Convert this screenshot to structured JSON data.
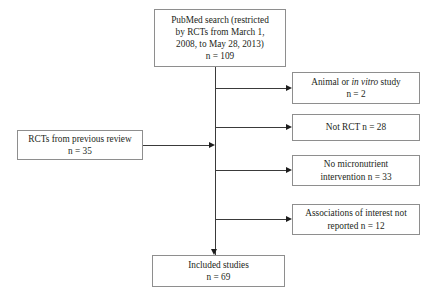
{
  "diagram": {
    "type": "flowchart",
    "colors": {
      "background": "#ffffff",
      "box_border": "#8e8e8e",
      "connector": "#3a3a3a",
      "arrowhead": "#1d1d1d",
      "text": "#231f20"
    },
    "source_box": {
      "name": "pubmed-search",
      "lines": [
        "PubMed search (restricted",
        "by RCTs from March 1,",
        "2008, to May 28, 2013)",
        "n = 109"
      ],
      "count_label": "n = 109",
      "count": 109
    },
    "input_box": {
      "name": "previous-review",
      "lines": [
        "RCTs from previous review",
        "n = 35"
      ],
      "count_label": "n = 35",
      "count": 35
    },
    "exclusions": [
      {
        "name": "animal-in-vitro",
        "line1_pre": "Animal or ",
        "line1_italic": "in vitro",
        "line1_post": " study",
        "line2": "n = 2",
        "count": 2
      },
      {
        "name": "not-rct",
        "line1": "Not RCT n = 28",
        "count": 28
      },
      {
        "name": "no-micronutrient-intervention",
        "line1": "No micronutrient",
        "line2": "intervention n = 33",
        "count": 33
      },
      {
        "name": "associations-not-reported",
        "line1": "Associations of interest not",
        "line2": "reported n = 12",
        "count": 12
      }
    ],
    "result_box": {
      "name": "included-studies",
      "lines": [
        "Included studies",
        "n = 69"
      ],
      "count_label": "n = 69",
      "count": 69
    }
  }
}
